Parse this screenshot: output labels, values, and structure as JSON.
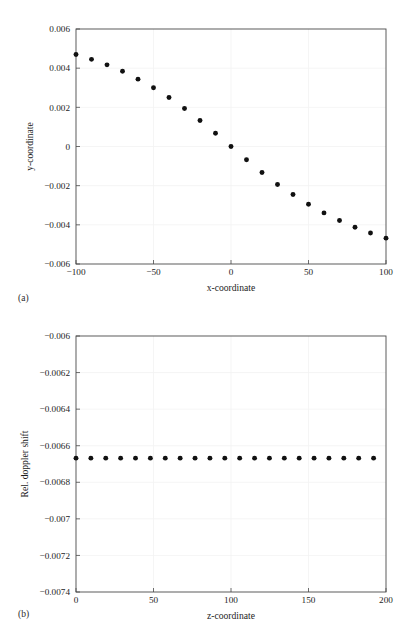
{
  "figure": {
    "panel_a_caption": "(a)",
    "panel_b_caption": "(b)",
    "marker_color": "#111111",
    "frame_color": "#4a4a4a",
    "grid_color": "#f2f2f2"
  },
  "chart_data": [
    {
      "type": "scatter",
      "panel": "(a)",
      "title": "",
      "xlabel": "x-coordinate",
      "ylabel": "y-coordinate",
      "xlim": [
        -100,
        100
      ],
      "ylim": [
        -0.006,
        0.006
      ],
      "xticks": [
        -100,
        -50,
        0,
        50,
        100
      ],
      "xtick_labels": [
        "−100",
        "−50",
        "0",
        "50",
        "100"
      ],
      "yticks": [
        0.006,
        0.004,
        0.002,
        0,
        -0.002,
        -0.004,
        -0.006
      ],
      "ytick_labels": [
        "0.006",
        "0.004",
        "0.002",
        "0",
        "−0.002",
        "−0.004",
        "−0.006"
      ],
      "grid": true,
      "legend": "none",
      "x": [
        -100,
        -90,
        -80,
        -70,
        -60,
        -50,
        -40,
        -30,
        -20,
        -10,
        0,
        10,
        20,
        30,
        40,
        50,
        60,
        70,
        80,
        90,
        100
      ],
      "y": [
        0.0047,
        0.00445,
        0.00417,
        0.00384,
        0.00344,
        0.003,
        0.0025,
        0.00194,
        0.00133,
        0.00068,
        0.0,
        -0.00068,
        -0.00133,
        -0.00194,
        -0.00245,
        -0.00295,
        -0.00339,
        -0.00378,
        -0.00412,
        -0.00442,
        -0.00468
      ]
    },
    {
      "type": "scatter",
      "panel": "(b)",
      "title": "",
      "xlabel": "z-coordinate",
      "ylabel": "Rel. doppler shift",
      "xlim": [
        0,
        200
      ],
      "ylim": [
        -0.0074,
        -0.006
      ],
      "xticks": [
        0,
        50,
        100,
        150,
        200
      ],
      "xtick_labels": [
        "0",
        "50",
        "100",
        "150",
        "200"
      ],
      "yticks": [
        -0.006,
        -0.0062,
        -0.0064,
        -0.0066,
        -0.0068,
        -0.007,
        -0.0072,
        -0.0074
      ],
      "ytick_labels": [
        "−0.006",
        "−0.0062",
        "−0.0064",
        "−0.0066",
        "−0.0068",
        "−0.007",
        "−0.0072",
        "−0.0074"
      ],
      "grid": true,
      "legend": "none",
      "x": [
        0,
        9.6,
        19.2,
        28.8,
        38.4,
        48,
        57.6,
        67.2,
        76.8,
        86.4,
        96,
        105.6,
        115.2,
        124.8,
        134.4,
        144,
        153.6,
        163.2,
        172.8,
        182.4,
        192
      ],
      "y": [
        -0.006668,
        -0.006668,
        -0.006668,
        -0.006668,
        -0.006668,
        -0.006668,
        -0.006668,
        -0.006668,
        -0.006668,
        -0.006668,
        -0.006668,
        -0.006668,
        -0.006668,
        -0.006668,
        -0.006668,
        -0.006668,
        -0.006668,
        -0.006668,
        -0.006668,
        -0.006668,
        -0.006668
      ]
    }
  ]
}
